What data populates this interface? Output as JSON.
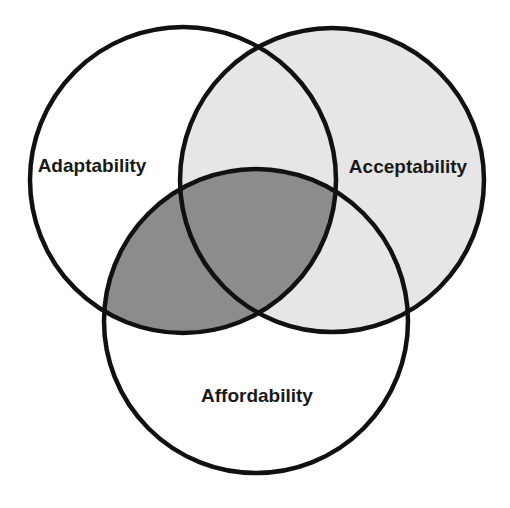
{
  "diagram": {
    "type": "venn-3",
    "sets": [
      {
        "id": "adaptability",
        "label": "Adaptability",
        "cx": 183,
        "cy": 180,
        "r": 153,
        "label_x": 92,
        "label_y": 172
      },
      {
        "id": "acceptability",
        "label": "Acceptability",
        "cx": 332,
        "cy": 180,
        "r": 152,
        "label_x": 408,
        "label_y": 173
      },
      {
        "id": "affordability",
        "label": "Affordability",
        "cx": 256,
        "cy": 321,
        "r": 152,
        "label_x": 257,
        "label_y": 402
      }
    ],
    "colors": {
      "acceptability_fill": "#e6e6e6",
      "triple_intersection_fill": "#8c8c8c",
      "stroke": "#111111",
      "background": "#ffffff"
    }
  }
}
